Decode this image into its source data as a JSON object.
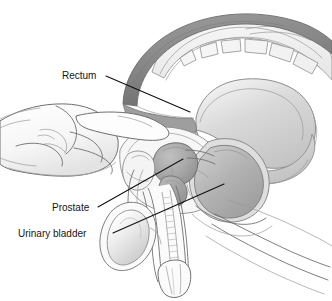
{
  "figure": {
    "width": 332,
    "height": 301,
    "background_color": "#ffffff",
    "style": "grayscale medical line illustration with wash shading"
  },
  "annotations": [
    {
      "id": "rectum",
      "label": "Rectum",
      "text_x": 62,
      "text_y": 79,
      "text_anchor": "start",
      "leader": "M 106 76 L 190 112",
      "target": "rectal wall above the examining finger"
    },
    {
      "id": "prostate",
      "label": "Prostate",
      "text_x": 52,
      "text_y": 211,
      "text_anchor": "start",
      "leader": "M 98 207 L 183 159",
      "target": "prostate gland"
    },
    {
      "id": "urinary-bladder",
      "label": "Urinary bladder",
      "text_x": 18,
      "text_y": 237,
      "text_anchor": "start",
      "leader": "M 113 233 L 224 184",
      "target": "urinary bladder lumen"
    }
  ],
  "colors": {
    "ink_outline": "#6f6f6f",
    "ink_dark": "#4f4f4f",
    "leader_line": "#111111",
    "label_text": "#141414",
    "rectum_dark": "#8a8a8a",
    "rectum_wall": "#b9b9b9",
    "prostate_fill": "#a9a9a9",
    "bladder_fill": "#b6b6b6",
    "bladder_wall": "#d5d5d5",
    "skin_light": "#fbfbfb",
    "skin_shade": "#dcdcdc",
    "bone_fill": "#f2f2f2",
    "tissue_light": "#ededed",
    "tissue_mid": "#cfcfcf"
  },
  "anatomy_parts": [
    {
      "id": "sacrum-arc",
      "name": "sacrum-and-coccyx-arc"
    },
    {
      "id": "vertebrae",
      "name": "vertebral-bodies"
    },
    {
      "id": "colon-arc",
      "name": "descending-colon-rectum-arc"
    },
    {
      "id": "buttock",
      "name": "gluteal-soft-tissue"
    },
    {
      "id": "rectum",
      "name": "rectum"
    },
    {
      "id": "bladder",
      "name": "urinary-bladder"
    },
    {
      "id": "prostate",
      "name": "prostate-gland"
    },
    {
      "id": "seminal-vesicle",
      "name": "seminal-vesicle"
    },
    {
      "id": "pubic-bone",
      "name": "pubic-symphysis"
    },
    {
      "id": "penis",
      "name": "penis-shaft"
    },
    {
      "id": "urethra",
      "name": "urethra"
    },
    {
      "id": "glans",
      "name": "glans-penis"
    },
    {
      "id": "testis",
      "name": "testis-and-scrotum"
    },
    {
      "id": "thigh",
      "name": "thigh-contour"
    },
    {
      "id": "hand",
      "name": "gloved-examining-hand"
    },
    {
      "id": "index-finger",
      "name": "index-finger"
    },
    {
      "id": "forearm",
      "name": "forearm"
    }
  ]
}
